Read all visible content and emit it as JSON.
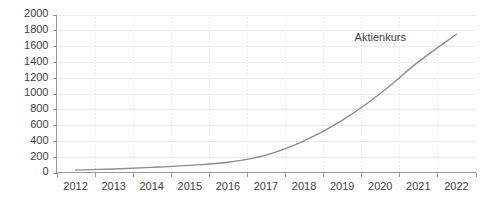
{
  "chart_data": {
    "type": "line",
    "title": "",
    "xlabel": "",
    "ylabel": "",
    "categories": [
      "2012",
      "2013",
      "2014",
      "2015",
      "2016",
      "2017",
      "2018",
      "2019",
      "2020",
      "2021",
      "2022"
    ],
    "series": [
      {
        "name": "Aktienkurs",
        "values": [
          30,
          45,
          65,
          90,
          130,
          220,
          400,
          660,
          1000,
          1400,
          1750
        ],
        "color": "#8c8c8c"
      }
    ],
    "ylim": [
      0,
      2000
    ],
    "y_ticks": [
      0,
      200,
      400,
      600,
      800,
      1000,
      1200,
      1400,
      1600,
      1800,
      2000
    ],
    "y_tick_labels": [
      "0",
      "200",
      "400",
      "600",
      "800",
      "1000",
      "1200",
      "1400",
      "1600",
      "1800",
      "2000"
    ],
    "x_tick_labels": [
      "2012",
      "2013",
      "2014",
      "2015",
      "2016",
      "2017",
      "2018",
      "2019",
      "2020",
      "2021",
      "2022"
    ],
    "grid": {
      "horizontal": true,
      "vertical": true,
      "horizontal_color": "#ececec",
      "vertical_color": "#e4e4e4"
    },
    "legend": {
      "position": "inline-right",
      "entries": [
        "Aktienkurs"
      ]
    },
    "annotations": [
      {
        "text": "Aktienkurs",
        "x_value": "2020",
        "y_value": 1700
      }
    ],
    "axis_color": "#9a9a9a",
    "background_color": "#ffffff",
    "text_color": "#3f3f3f"
  },
  "chart": {
    "series_label": "Aktienkurs"
  }
}
